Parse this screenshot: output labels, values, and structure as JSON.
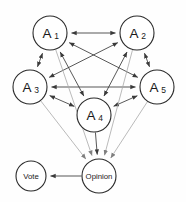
{
  "diagram": {
    "background_color": "#fefefe",
    "node_stroke_color": "#2b2b2b",
    "edge_color_dark": "#3a3a3a",
    "edge_color_light": "#a8a8a8",
    "nodes": [
      {
        "id": "A1",
        "base": "A",
        "sub": "1",
        "label": "A1",
        "cx": 50,
        "cy": 33,
        "r": 17,
        "kind": "agent"
      },
      {
        "id": "A2",
        "base": "A",
        "sub": "2",
        "label": "A2",
        "cx": 137,
        "cy": 33,
        "r": 17,
        "kind": "agent"
      },
      {
        "id": "A3",
        "base": "A",
        "sub": "3",
        "label": "A3",
        "cx": 30,
        "cy": 87,
        "r": 17,
        "kind": "agent"
      },
      {
        "id": "A4",
        "base": "A",
        "sub": "4",
        "label": "A4",
        "cx": 94,
        "cy": 115,
        "r": 17,
        "kind": "agent"
      },
      {
        "id": "A5",
        "base": "A",
        "sub": "5",
        "label": "A5",
        "cx": 157,
        "cy": 87,
        "r": 17,
        "kind": "agent"
      },
      {
        "id": "Opinion",
        "base": "Opinion",
        "sub": "",
        "label": "Opinion",
        "cx": 99,
        "cy": 176,
        "r": 17,
        "kind": "aggregate"
      },
      {
        "id": "Vote",
        "base": "Vote",
        "sub": "",
        "label": "Vote",
        "cx": 31,
        "cy": 176,
        "r": 15,
        "kind": "output"
      }
    ],
    "edges": [
      {
        "from": "A1",
        "to": "A2",
        "style": "dark",
        "arrows": "both"
      },
      {
        "from": "A1",
        "to": "A3",
        "style": "dark",
        "arrows": "both"
      },
      {
        "from": "A1",
        "to": "A4",
        "style": "dark",
        "arrows": "both"
      },
      {
        "from": "A1",
        "to": "A5",
        "style": "dark",
        "arrows": "both"
      },
      {
        "from": "A2",
        "to": "A3",
        "style": "dark",
        "arrows": "both"
      },
      {
        "from": "A2",
        "to": "A4",
        "style": "dark",
        "arrows": "both"
      },
      {
        "from": "A2",
        "to": "A5",
        "style": "dark",
        "arrows": "both"
      },
      {
        "from": "A3",
        "to": "A4",
        "style": "dark",
        "arrows": "both"
      },
      {
        "from": "A3",
        "to": "A5",
        "style": "dark",
        "arrows": "both"
      },
      {
        "from": "A4",
        "to": "A5",
        "style": "dark",
        "arrows": "both"
      },
      {
        "from": "A1",
        "to": "Opinion",
        "style": "light",
        "arrows": "end"
      },
      {
        "from": "A2",
        "to": "Opinion",
        "style": "light",
        "arrows": "end"
      },
      {
        "from": "A3",
        "to": "Opinion",
        "style": "light",
        "arrows": "end"
      },
      {
        "from": "A4",
        "to": "Opinion",
        "style": "dark",
        "arrows": "end"
      },
      {
        "from": "A5",
        "to": "Opinion",
        "style": "light",
        "arrows": "end"
      },
      {
        "from": "Opinion",
        "to": "Vote",
        "style": "dark",
        "arrows": "end"
      }
    ]
  }
}
